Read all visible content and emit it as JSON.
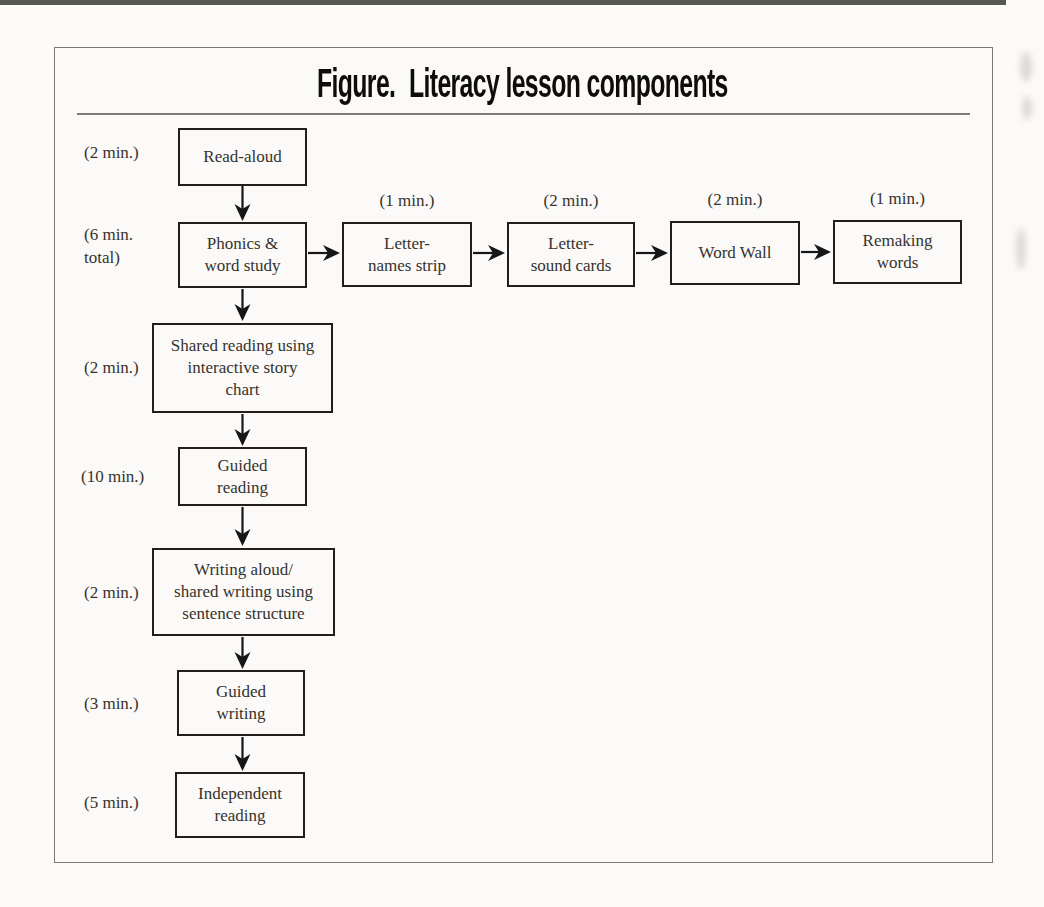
{
  "title": {
    "prefix": "Figure.",
    "text": "Literacy lesson components"
  },
  "main_sequence": [
    {
      "time": "(2 min.)",
      "label": "Read-aloud"
    },
    {
      "time": "(6 min.\ntotal)",
      "label": "Phonics &\nword study"
    },
    {
      "time": "(2 min.)",
      "label": "Shared reading using\ninteractive story\nchart"
    },
    {
      "time": "(10 min.)",
      "label": "Guided\nreading"
    },
    {
      "time": "(2 min.)",
      "label": "Writing aloud/\nshared writing using\nsentence structure"
    },
    {
      "time": "(3 min.)",
      "label": "Guided\nwriting"
    },
    {
      "time": "(5 min.)",
      "label": "Independent\nreading"
    }
  ],
  "phonics_sequence": [
    {
      "time": "(1 min.)",
      "label": "Letter-\nnames strip"
    },
    {
      "time": "(2 min.)",
      "label": "Letter-\nsound cards"
    },
    {
      "time": "(2 min.)",
      "label": "Word Wall"
    },
    {
      "time": "(1 min.)",
      "label": "Remaking\nwords"
    }
  ],
  "colors": {
    "background": "#fbfaf8",
    "box_border": "#211e1b",
    "text": "#36322d",
    "title": "#0e0d0c",
    "frame_border": "#7c7a77",
    "arrow": "#161616"
  }
}
